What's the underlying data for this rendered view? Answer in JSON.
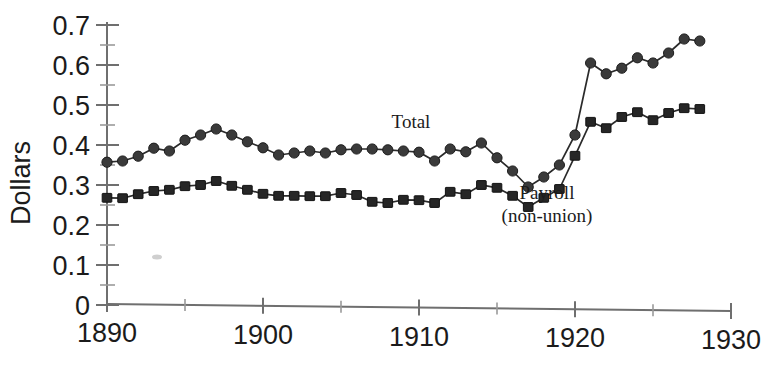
{
  "chart_data": {
    "type": "line",
    "title": "",
    "xlabel": "",
    "ylabel": "Dollars",
    "xlim": [
      1890,
      1930
    ],
    "ylim": [
      0,
      0.7
    ],
    "grid": false,
    "legend_position": "inline-annotations",
    "x_ticks": [
      1890,
      1900,
      1910,
      1920,
      1930
    ],
    "x_tick_labels": [
      "1890",
      "1900",
      "1910",
      "1920",
      "1930"
    ],
    "x_minor_tick_interval": 5,
    "y_ticks": [
      0,
      0.1,
      0.2,
      0.3,
      0.4,
      0.5,
      0.6,
      0.7
    ],
    "y_tick_labels": [
      "0",
      "0.1",
      "0.2",
      "0.3",
      "0.4",
      "0.5",
      "0.6",
      "0.7"
    ],
    "y_minor_tick_interval": 0.05,
    "x": [
      1890,
      1891,
      1892,
      1893,
      1894,
      1895,
      1896,
      1897,
      1898,
      1899,
      1900,
      1901,
      1902,
      1903,
      1904,
      1905,
      1906,
      1907,
      1908,
      1909,
      1910,
      1911,
      1912,
      1913,
      1914,
      1915,
      1916,
      1917,
      1918,
      1919,
      1920,
      1921,
      1922,
      1923,
      1924,
      1925,
      1926,
      1927,
      1928
    ],
    "series": [
      {
        "name": "Total",
        "marker": "circle",
        "values": [
          0.357,
          0.36,
          0.372,
          0.392,
          0.385,
          0.412,
          0.425,
          0.44,
          0.425,
          0.408,
          0.393,
          0.375,
          0.38,
          0.385,
          0.38,
          0.388,
          0.39,
          0.39,
          0.388,
          0.385,
          0.382,
          0.36,
          0.39,
          0.383,
          0.405,
          0.368,
          0.335,
          0.295,
          0.32,
          0.35,
          0.425,
          0.605,
          0.578,
          0.592,
          0.618,
          0.605,
          0.63,
          0.665,
          0.66
        ]
      },
      {
        "name": "Payroll (non-union)",
        "marker": "square",
        "values": [
          0.268,
          0.267,
          0.277,
          0.285,
          0.288,
          0.297,
          0.3,
          0.31,
          0.298,
          0.288,
          0.278,
          0.273,
          0.273,
          0.272,
          0.272,
          0.28,
          0.275,
          0.258,
          0.255,
          0.263,
          0.262,
          0.255,
          0.283,
          0.277,
          0.3,
          0.293,
          0.273,
          0.245,
          0.268,
          0.29,
          0.373,
          0.458,
          0.442,
          0.47,
          0.482,
          0.462,
          0.48,
          0.492,
          0.49
        ]
      }
    ],
    "annotations": [
      {
        "text": "Total",
        "x_px": 411,
        "y_px": 128
      },
      {
        "text": "Payroll",
        "x_px": 547,
        "y_px": 199
      },
      {
        "text": "(non-union)",
        "x_px": 547,
        "y_px": 222
      }
    ]
  },
  "axis": {
    "y_label": "Dollars"
  },
  "colors": {
    "background": "#ffffff",
    "axis": "#6f6f6f",
    "line": "#2b2b2b",
    "marker_circle": "#3a3a3a",
    "marker_square": "#262626",
    "text": "#1b1b1b"
  }
}
